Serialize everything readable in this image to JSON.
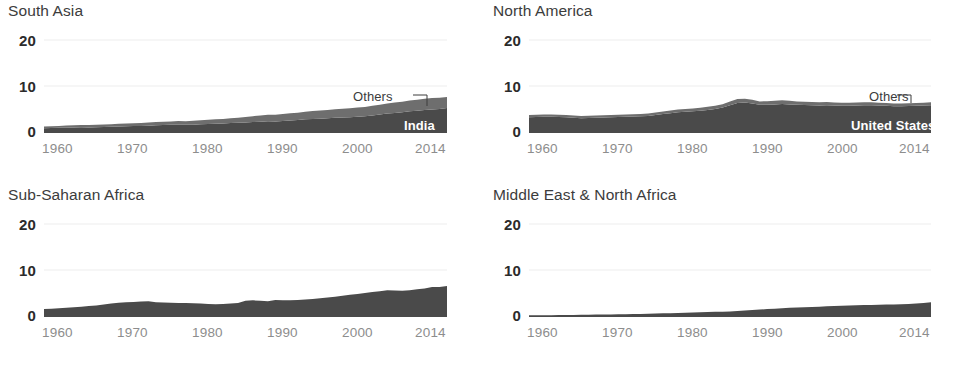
{
  "figure": {
    "background": "#ffffff",
    "panel_count": 4,
    "layout": "2x2 small multiples"
  },
  "style": {
    "color_primary": "#4a4a4a",
    "color_secondary": "#6e6e6e",
    "color_gridline": "#ededed",
    "color_ytick": "#2b2b2b",
    "color_xtick": "#8d8d8d",
    "color_title": "#3c3c3c",
    "color_label_inner": "#ffffff",
    "color_leader": "#3c3c3c"
  },
  "axes": {
    "yticks": [
      "0",
      "10",
      "20"
    ],
    "ylim": [
      0,
      22
    ],
    "xticks": [
      "1960",
      "1970",
      "1980",
      "1990",
      "2000",
      "2014"
    ],
    "xtick_values": [
      1960,
      1970,
      1980,
      1990,
      2000,
      2014
    ],
    "xlim": [
      1960,
      2014
    ],
    "grid": "horizontal gridlines at 10 and 20 only",
    "legend_position": "inline annotations on area"
  },
  "chart_data": [
    {
      "type": "area",
      "title": "South Asia",
      "xlabel": "",
      "ylabel": "",
      "ylim": [
        0,
        22
      ],
      "xlim": [
        1960,
        2014
      ],
      "stacked": true,
      "x": [
        1960,
        1961,
        1962,
        1963,
        1964,
        1965,
        1966,
        1967,
        1968,
        1969,
        1970,
        1971,
        1972,
        1973,
        1974,
        1975,
        1976,
        1977,
        1978,
        1979,
        1980,
        1981,
        1982,
        1983,
        1984,
        1985,
        1986,
        1987,
        1988,
        1989,
        1990,
        1991,
        1992,
        1993,
        1994,
        1995,
        1996,
        1997,
        1998,
        1999,
        2000,
        2001,
        2002,
        2003,
        2004,
        2005,
        2006,
        2007,
        2008,
        2009,
        2010,
        2011,
        2012,
        2013,
        2014
      ],
      "series": [
        {
          "name": "India",
          "values": [
            0.8,
            0.85,
            0.9,
            0.95,
            1.0,
            1.05,
            1.0,
            1.05,
            1.1,
            1.15,
            1.2,
            1.25,
            1.3,
            1.3,
            1.35,
            1.45,
            1.5,
            1.55,
            1.6,
            1.55,
            1.6,
            1.7,
            1.75,
            1.8,
            1.85,
            1.95,
            2.0,
            2.05,
            2.15,
            2.25,
            2.35,
            2.3,
            2.4,
            2.5,
            2.6,
            2.75,
            2.85,
            2.9,
            3.0,
            3.1,
            3.15,
            3.2,
            3.3,
            3.4,
            3.6,
            3.8,
            4.0,
            4.15,
            4.3,
            4.5,
            4.6,
            4.8,
            4.9,
            5.0,
            5.2
          ]
        },
        {
          "name": "Others",
          "values": [
            0.4,
            0.4,
            0.42,
            0.45,
            0.45,
            0.48,
            0.5,
            0.5,
            0.52,
            0.55,
            0.58,
            0.6,
            0.62,
            0.65,
            0.7,
            0.7,
            0.72,
            0.75,
            0.78,
            0.8,
            0.85,
            0.88,
            0.9,
            0.95,
            1.0,
            1.05,
            1.1,
            1.2,
            1.3,
            1.35,
            1.4,
            1.45,
            1.5,
            1.55,
            1.6,
            1.65,
            1.7,
            1.75,
            1.8,
            1.85,
            1.9,
            1.95,
            2.0,
            2.05,
            2.1,
            2.15,
            2.2,
            2.25,
            2.3,
            2.35,
            2.4,
            2.45,
            2.5,
            2.45,
            2.4
          ]
        }
      ],
      "annotations": [
        {
          "text": "India",
          "kind": "inner-white-label"
        },
        {
          "text": "Others",
          "kind": "leader-line-label"
        }
      ]
    },
    {
      "type": "area",
      "title": "North America",
      "xlabel": "",
      "ylabel": "",
      "ylim": [
        0,
        22
      ],
      "xlim": [
        1960,
        2014
      ],
      "stacked": true,
      "x": [
        1960,
        1961,
        1962,
        1963,
        1964,
        1965,
        1966,
        1967,
        1968,
        1969,
        1970,
        1971,
        1972,
        1973,
        1974,
        1975,
        1976,
        1977,
        1978,
        1979,
        1980,
        1981,
        1982,
        1983,
        1984,
        1985,
        1986,
        1987,
        1988,
        1989,
        1990,
        1991,
        1992,
        1993,
        1994,
        1995,
        1996,
        1997,
        1998,
        1999,
        2000,
        2001,
        2002,
        2003,
        2004,
        2005,
        2006,
        2007,
        2008,
        2009,
        2010,
        2011,
        2012,
        2013,
        2014
      ],
      "series": [
        {
          "name": "United States",
          "values": [
            3.2,
            3.25,
            3.3,
            3.3,
            3.25,
            3.2,
            3.1,
            3.0,
            3.05,
            3.1,
            3.15,
            3.2,
            3.25,
            3.3,
            3.35,
            3.4,
            3.5,
            3.7,
            3.9,
            4.1,
            4.3,
            4.4,
            4.5,
            4.6,
            4.8,
            5.0,
            5.3,
            5.8,
            6.3,
            6.4,
            6.2,
            5.9,
            5.9,
            6.0,
            6.1,
            6.0,
            5.9,
            5.85,
            5.8,
            5.75,
            5.8,
            5.75,
            5.7,
            5.7,
            5.75,
            5.8,
            5.8,
            5.75,
            5.7,
            5.6,
            5.6,
            5.65,
            5.7,
            5.75,
            5.8
          ]
        },
        {
          "name": "Others",
          "values": [
            0.5,
            0.5,
            0.5,
            0.5,
            0.5,
            0.5,
            0.5,
            0.5,
            0.5,
            0.5,
            0.5,
            0.5,
            0.5,
            0.5,
            0.5,
            0.5,
            0.5,
            0.52,
            0.55,
            0.58,
            0.6,
            0.6,
            0.62,
            0.65,
            0.68,
            0.7,
            0.75,
            0.85,
            0.9,
            0.85,
            0.8,
            0.75,
            0.78,
            0.8,
            0.8,
            0.78,
            0.75,
            0.72,
            0.7,
            0.7,
            0.7,
            0.68,
            0.65,
            0.65,
            0.65,
            0.65,
            0.65,
            0.62,
            0.6,
            0.58,
            0.58,
            0.6,
            0.6,
            0.62,
            0.65
          ]
        }
      ],
      "annotations": [
        {
          "text": "United States",
          "kind": "inner-white-label"
        },
        {
          "text": "Others",
          "kind": "leader-line-label"
        }
      ]
    },
    {
      "type": "area",
      "title": "Sub-Saharan Africa",
      "xlabel": "",
      "ylabel": "",
      "ylim": [
        0,
        22
      ],
      "xlim": [
        1960,
        2014
      ],
      "stacked": false,
      "x": [
        1960,
        1961,
        1962,
        1963,
        1964,
        1965,
        1966,
        1967,
        1968,
        1969,
        1970,
        1971,
        1972,
        1973,
        1974,
        1975,
        1976,
        1977,
        1978,
        1979,
        1980,
        1981,
        1982,
        1983,
        1984,
        1985,
        1986,
        1987,
        1988,
        1989,
        1990,
        1991,
        1992,
        1993,
        1994,
        1995,
        1996,
        1997,
        1998,
        1999,
        2000,
        2001,
        2002,
        2003,
        2004,
        2005,
        2006,
        2007,
        2008,
        2009,
        2010,
        2011,
        2012,
        2013,
        2014
      ],
      "series": [
        {
          "name": "Sub-Saharan Africa",
          "values": [
            1.5,
            1.6,
            1.7,
            1.8,
            1.9,
            2.0,
            2.15,
            2.3,
            2.5,
            2.7,
            2.9,
            3.0,
            3.05,
            3.15,
            3.2,
            3.0,
            2.95,
            2.9,
            2.85,
            2.8,
            2.75,
            2.7,
            2.6,
            2.55,
            2.6,
            2.7,
            2.8,
            3.3,
            3.4,
            3.3,
            3.2,
            3.5,
            3.45,
            3.4,
            3.5,
            3.6,
            3.7,
            3.85,
            4.0,
            4.2,
            4.4,
            4.6,
            4.8,
            5.0,
            5.2,
            5.4,
            5.6,
            5.55,
            5.5,
            5.6,
            5.8,
            6.0,
            6.3,
            6.3,
            6.5
          ]
        }
      ],
      "annotations": []
    },
    {
      "type": "area",
      "title": "Middle East & North Africa",
      "xlabel": "",
      "ylabel": "",
      "ylim": [
        0,
        22
      ],
      "xlim": [
        1960,
        2014
      ],
      "stacked": false,
      "x": [
        1960,
        1961,
        1962,
        1963,
        1964,
        1965,
        1966,
        1967,
        1968,
        1969,
        1970,
        1971,
        1972,
        1973,
        1974,
        1975,
        1976,
        1977,
        1978,
        1979,
        1980,
        1981,
        1982,
        1983,
        1984,
        1985,
        1986,
        1987,
        1988,
        1989,
        1990,
        1991,
        1992,
        1993,
        1994,
        1995,
        1996,
        1997,
        1998,
        1999,
        2000,
        2001,
        2002,
        2003,
        2004,
        2005,
        2006,
        2007,
        2008,
        2009,
        2010,
        2011,
        2012,
        2013,
        2014
      ],
      "series": [
        {
          "name": "Middle East & North Africa",
          "values": [
            0.15,
            0.16,
            0.17,
            0.18,
            0.2,
            0.22,
            0.24,
            0.26,
            0.28,
            0.3,
            0.32,
            0.35,
            0.38,
            0.4,
            0.42,
            0.45,
            0.5,
            0.55,
            0.6,
            0.62,
            0.65,
            0.7,
            0.75,
            0.8,
            0.85,
            0.9,
            0.95,
            1.0,
            1.1,
            1.2,
            1.3,
            1.4,
            1.5,
            1.6,
            1.7,
            1.8,
            1.85,
            1.9,
            1.95,
            2.0,
            2.1,
            2.2,
            2.25,
            2.3,
            2.35,
            2.4,
            2.4,
            2.45,
            2.5,
            2.5,
            2.55,
            2.6,
            2.7,
            2.85,
            3.0
          ]
        }
      ],
      "annotations": []
    }
  ]
}
